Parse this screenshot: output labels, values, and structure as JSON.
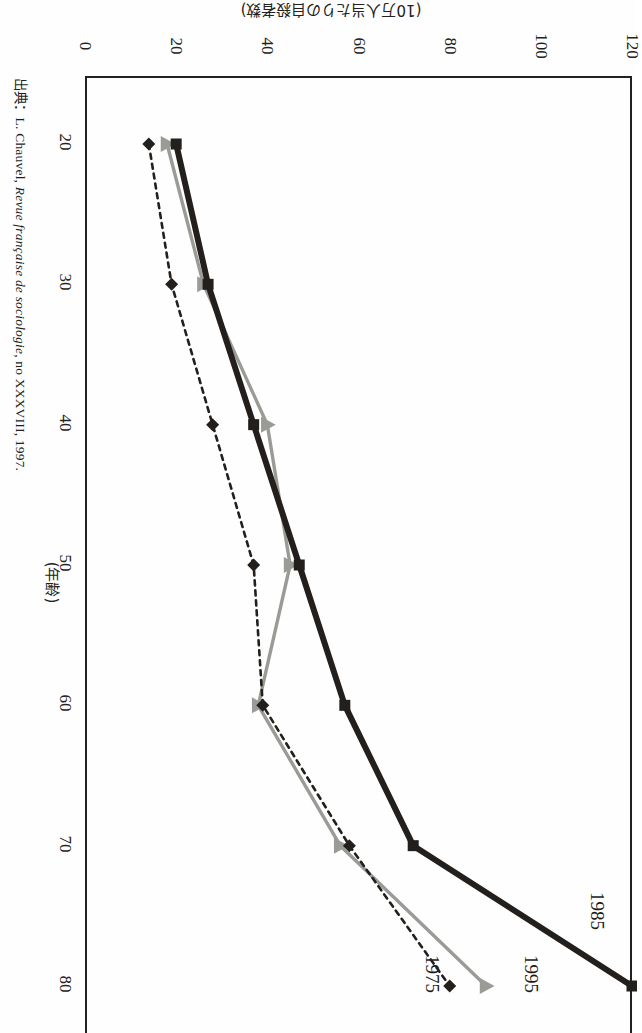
{
  "figure": {
    "value_axis_label": "(10万人当たりの自殺者数)",
    "category_axis_label": "(年齢)",
    "source_prefix": "出典：L. Chauvel, ",
    "source_italic": "Revue française de sociologie",
    "source_suffix": ", no XXXVIII, 1997."
  },
  "colors": {
    "series_1985": "#231f1d",
    "series_1995": "#9a9b96",
    "series_1975": "#231f1d",
    "axis": "#23211e",
    "background": "#fefefe"
  },
  "chart_data": {
    "type": "line",
    "title": "",
    "orientation": "rotated-90",
    "xlabel": "(年齢)",
    "ylabel": "(10万人当たりの自殺者数)",
    "xlim": [
      15,
      83
    ],
    "ylim": [
      0,
      120
    ],
    "grid": false,
    "legend": "inline-end-labels",
    "x": [
      20,
      30,
      40,
      50,
      60,
      70,
      80
    ],
    "xticks": [
      "20",
      "30",
      "40",
      "50",
      "60",
      "70",
      "80"
    ],
    "yticks": [
      "0",
      "20",
      "40",
      "60",
      "80",
      "100",
      "120"
    ],
    "series": [
      {
        "name": "1985",
        "marker": "square",
        "line": "solid-thick",
        "color": "#231f1d",
        "values": [
          20,
          27,
          37,
          47,
          57,
          72,
          120
        ]
      },
      {
        "name": "1995",
        "marker": "triangle",
        "line": "solid",
        "color": "#9a9b96",
        "values": [
          18,
          26,
          40,
          45,
          38,
          56,
          88
        ]
      },
      {
        "name": "1975",
        "marker": "diamond",
        "line": "dashed",
        "color": "#231f1d",
        "values": [
          14,
          19,
          28,
          37,
          39,
          58,
          80
        ]
      }
    ]
  },
  "ticks": {
    "value": [
      {
        "label": "0",
        "v": 0
      },
      {
        "label": "20",
        "v": 20
      },
      {
        "label": "40",
        "v": 40
      },
      {
        "label": "60",
        "v": 60
      },
      {
        "label": "80",
        "v": 80
      },
      {
        "label": "100",
        "v": 100
      },
      {
        "label": "120",
        "v": 120
      }
    ],
    "category": [
      {
        "label": "20",
        "a": 20
      },
      {
        "label": "30",
        "a": 30
      },
      {
        "label": "40",
        "a": 40
      },
      {
        "label": "50",
        "a": 50
      },
      {
        "label": "60",
        "a": 60
      },
      {
        "label": "70",
        "a": 70
      },
      {
        "label": "80",
        "a": 80
      }
    ]
  },
  "series_labels": [
    {
      "name": "1985",
      "left": 578,
      "top": 900
    },
    {
      "name": "1995",
      "left": 512,
      "top": 963
    },
    {
      "name": "1975",
      "left": 413,
      "top": 963
    }
  ]
}
